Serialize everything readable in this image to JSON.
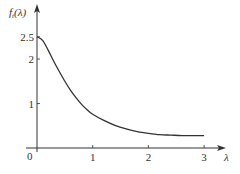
{
  "chart_data": {
    "type": "line",
    "title": "",
    "xlabel": "λ",
    "ylabel": "f_t(λ)",
    "ylabel_main": "f",
    "ylabel_sub": "t",
    "ylabel_arg": "(λ)",
    "origin_label": "0",
    "xlim": [
      0,
      3.25
    ],
    "ylim": [
      0,
      3.0
    ],
    "grid": false,
    "legend": null,
    "x_ticks": [
      1,
      2,
      3
    ],
    "x_tick_labels": [
      "1",
      "2",
      "3"
    ],
    "y_ticks": [
      1,
      2,
      2.5
    ],
    "y_tick_labels": [
      "1",
      "2",
      "2.5"
    ],
    "series": [
      {
        "name": "f_t(λ)",
        "color": "#333333",
        "x": [
          0,
          0.1,
          0.2,
          0.3,
          0.4,
          0.5,
          0.6,
          0.7,
          0.8,
          0.9,
          1.0,
          1.2,
          1.4,
          1.6,
          1.8,
          2.0,
          2.2,
          2.4,
          2.6,
          2.8,
          3.0
        ],
        "y": [
          2.5,
          2.42,
          2.2,
          1.95,
          1.72,
          1.5,
          1.3,
          1.13,
          0.98,
          0.86,
          0.76,
          0.62,
          0.51,
          0.43,
          0.37,
          0.33,
          0.3,
          0.29,
          0.28,
          0.28,
          0.28
        ]
      }
    ]
  },
  "colors": {
    "axis": "#333333",
    "curve": "#333333",
    "text": "#333333"
  }
}
